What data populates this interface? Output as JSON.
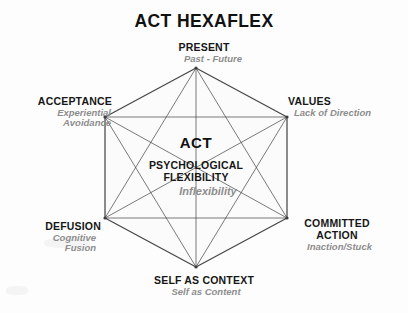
{
  "title": "ACT HEXAFLEX",
  "colors": {
    "background": "#fdfdfd",
    "text_dark": "#161616",
    "text_gray": "#8d8d8d",
    "line": "#3d3d3d",
    "shape_fill": "#fbfbfb"
  },
  "center": {
    "acronym": "ACT",
    "line1": "PSYCHOLOGICAL",
    "line2": "FLEXIBILITY",
    "contrast": "Inflexibility"
  },
  "nodes": [
    {
      "id": "present",
      "label": "PRESENT",
      "sublabel": "Past - Future"
    },
    {
      "id": "values",
      "label": "VALUES",
      "sublabel": "Lack of Direction"
    },
    {
      "id": "committed",
      "label": "COMMITTED",
      "label2": "ACTION",
      "sublabel": "Inaction/Stuck"
    },
    {
      "id": "selfcontext",
      "label": "SELF AS CONTEXT",
      "sublabel": "Self as Content"
    },
    {
      "id": "defusion",
      "label": "DEFUSION",
      "sublabel": "Cognitive",
      "sublabel2": "Fusion"
    },
    {
      "id": "acceptance",
      "label": "ACCEPTANCE",
      "sublabel": "Experiential",
      "sublabel2": "Avoidance"
    }
  ],
  "chart_data": {
    "type": "diagram",
    "shape": "hexagon",
    "vertices": [
      {
        "name": "present",
        "x": 196,
        "y": 68
      },
      {
        "name": "values",
        "x": 287,
        "y": 117
      },
      {
        "name": "committed",
        "x": 287,
        "y": 218
      },
      {
        "name": "selfcontext",
        "x": 196,
        "y": 267
      },
      {
        "name": "defusion",
        "x": 105,
        "y": 218
      },
      {
        "name": "acceptance",
        "x": 105,
        "y": 117
      }
    ],
    "edges": "complete-graph-all-pairs",
    "edge_count": 15
  }
}
